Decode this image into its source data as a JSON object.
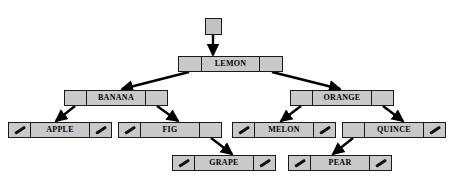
{
  "diagram": {
    "root_label": "root",
    "colors": {
      "node_fill": "#c9c9c9",
      "node_border": "#1a1a1a",
      "edge": "#000000",
      "background": "#ffffff",
      "text": "#000000"
    },
    "root_pointer": {
      "name": "root-handle",
      "x": 205,
      "y": 18,
      "w": 17,
      "h": 17,
      "label_x": 203,
      "label_y": 6,
      "points_to": "LEMON"
    },
    "nodes": [
      {
        "id": "lemon",
        "label": "LEMON",
        "x": 178,
        "y": 56,
        "w": 105,
        "left_null": false,
        "right_null": false,
        "left_child": "banana",
        "right_child": "orange"
      },
      {
        "id": "banana",
        "label": "BANANA",
        "x": 64,
        "y": 90,
        "w": 104,
        "left_null": false,
        "right_null": false,
        "left_child": "apple",
        "right_child": "fig"
      },
      {
        "id": "orange",
        "label": "ORANGE",
        "x": 290,
        "y": 90,
        "w": 104,
        "left_null": false,
        "right_null": false,
        "left_child": "melon",
        "right_child": "quince"
      },
      {
        "id": "apple",
        "label": "APPLE",
        "x": 8,
        "y": 122,
        "w": 104,
        "left_null": true,
        "right_null": true,
        "left_child": null,
        "right_child": null
      },
      {
        "id": "fig",
        "label": "FIG",
        "x": 118,
        "y": 122,
        "w": 104,
        "left_null": true,
        "right_null": false,
        "left_child": null,
        "right_child": "grape"
      },
      {
        "id": "melon",
        "label": "MELON",
        "x": 232,
        "y": 122,
        "w": 104,
        "left_null": true,
        "right_null": true,
        "left_child": null,
        "right_child": null
      },
      {
        "id": "quince",
        "label": "QUINCE",
        "x": 342,
        "y": 122,
        "w": 104,
        "left_null": false,
        "right_null": true,
        "left_child": "pear",
        "right_child": null
      },
      {
        "id": "grape",
        "label": "GRAPE",
        "x": 172,
        "y": 155,
        "w": 104,
        "left_null": true,
        "right_null": true,
        "left_child": null,
        "right_child": null
      },
      {
        "id": "pear",
        "label": "PEAR",
        "x": 288,
        "y": 155,
        "w": 104,
        "left_null": true,
        "right_null": true,
        "left_child": null,
        "right_child": null
      }
    ],
    "edges": [
      {
        "name": "edge-root-to-lemon",
        "from": "root-handle",
        "to": "lemon",
        "x1": 213,
        "y1": 35,
        "x2": 213,
        "y2": 55
      },
      {
        "name": "edge-lemon-to-banana",
        "from": "lemon",
        "to": "banana",
        "x1": 189,
        "y1": 72,
        "x2": 122,
        "y2": 89
      },
      {
        "name": "edge-lemon-to-orange",
        "from": "lemon",
        "to": "orange",
        "x1": 272,
        "y1": 72,
        "x2": 340,
        "y2": 89
      },
      {
        "name": "edge-banana-to-apple",
        "from": "banana",
        "to": "apple",
        "x1": 75,
        "y1": 106,
        "x2": 56,
        "y2": 121
      },
      {
        "name": "edge-banana-to-fig",
        "from": "banana",
        "to": "fig",
        "x1": 157,
        "y1": 106,
        "x2": 178,
        "y2": 121
      },
      {
        "name": "edge-orange-to-melon",
        "from": "orange",
        "to": "melon",
        "x1": 301,
        "y1": 106,
        "x2": 281,
        "y2": 121
      },
      {
        "name": "edge-orange-to-quince",
        "from": "orange",
        "to": "quince",
        "x1": 383,
        "y1": 106,
        "x2": 403,
        "y2": 121
      },
      {
        "name": "edge-fig-to-grape",
        "from": "fig",
        "to": "grape",
        "x1": 211,
        "y1": 138,
        "x2": 232,
        "y2": 154
      },
      {
        "name": "edge-quince-to-pear",
        "from": "quince",
        "to": "pear",
        "x1": 353,
        "y1": 138,
        "x2": 333,
        "y2": 154
      }
    ]
  }
}
